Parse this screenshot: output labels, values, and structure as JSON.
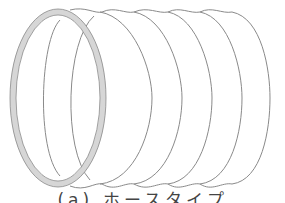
{
  "figure": {
    "rib_count": 6,
    "stroke_color": "#8a8a8a",
    "ring_fill_color": "#d6d6d6"
  },
  "caption": {
    "text": "(a) ホースタイプ"
  }
}
